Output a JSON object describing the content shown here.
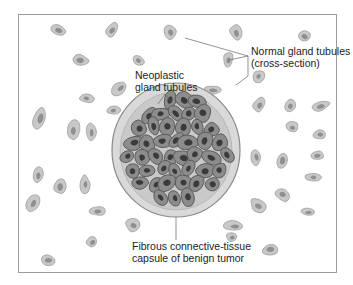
{
  "figure": {
    "labels": {
      "normal": {
        "line1": "Normal gland tubules",
        "line2": "(cross-section)"
      },
      "neoplastic": {
        "line1": "Neoplastic",
        "line2": "gland tubules"
      },
      "capsule": {
        "line1": "Fibrous connective-tissue",
        "line2": "capsule of benign tumor"
      }
    },
    "colors": {
      "frame": "#9a9a9a",
      "normal_outer": "#c8c8c8",
      "normal_outer_stroke": "#9e9e9e",
      "normal_inner": "#8f8f8f",
      "capsule_fill": "#d9d9d9",
      "capsule_stroke": "#8a8a8a",
      "neoplastic_fill": "#8c8c8c",
      "neoplastic_stroke": "#555555",
      "neoplastic_nucleus": "#3a3a3a",
      "leader": "#666666"
    }
  }
}
